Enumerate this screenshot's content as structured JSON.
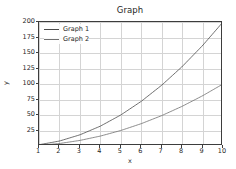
{
  "chart_data": {
    "type": "line",
    "title": "Graph",
    "xlabel": "x",
    "ylabel": "y",
    "xlim": [
      1,
      10
    ],
    "ylim": [
      0,
      200
    ],
    "grid": true,
    "legend_position": "upper left",
    "xticks": [
      1,
      2,
      3,
      4,
      5,
      6,
      7,
      8,
      9,
      10
    ],
    "yticks": [
      25,
      50,
      75,
      100,
      125,
      150,
      175,
      200
    ],
    "x": [
      1,
      2,
      3,
      4,
      5,
      6,
      7,
      8,
      9,
      10
    ],
    "series": [
      {
        "name": "Graph 1",
        "color": "#4a4a4a",
        "values": [
          2,
          8,
          18,
          32,
          50,
          72,
          98,
          128,
          162,
          200
        ]
      },
      {
        "name": "Graph 2",
        "color": "#6e6e6e",
        "values": [
          1,
          4,
          9,
          16,
          25,
          36,
          49,
          64,
          81,
          100
        ]
      }
    ]
  },
  "figure": {
    "background_color": "#ffffff",
    "axes_color": "#3d3d3d",
    "grid_color": "#d4d4d4",
    "text_color": "#262626"
  }
}
